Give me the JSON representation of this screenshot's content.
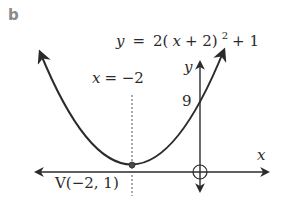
{
  "part_label": "b",
  "equation": {
    "lhs": "y",
    "eq": "=",
    "body_before": "2(",
    "var": "x",
    "body_mid": " + 2)",
    "exponent": "2",
    "body_after": " + 1",
    "full": "y = 2(x + 2)^2 + 1"
  },
  "axis_of_symmetry": {
    "var": "x",
    "text": " = −2",
    "full": "x = −2"
  },
  "y_intercept_label": "9",
  "vertex_label": "V(−2, 1)",
  "axes": {
    "x_label": "x",
    "y_label": "y"
  },
  "colors": {
    "curve": "#2b2b2b",
    "axes": "#2b2b2b",
    "text": "#2a2a2a",
    "part_label": "#8a8a8a",
    "dotted_line": "#555555"
  }
}
